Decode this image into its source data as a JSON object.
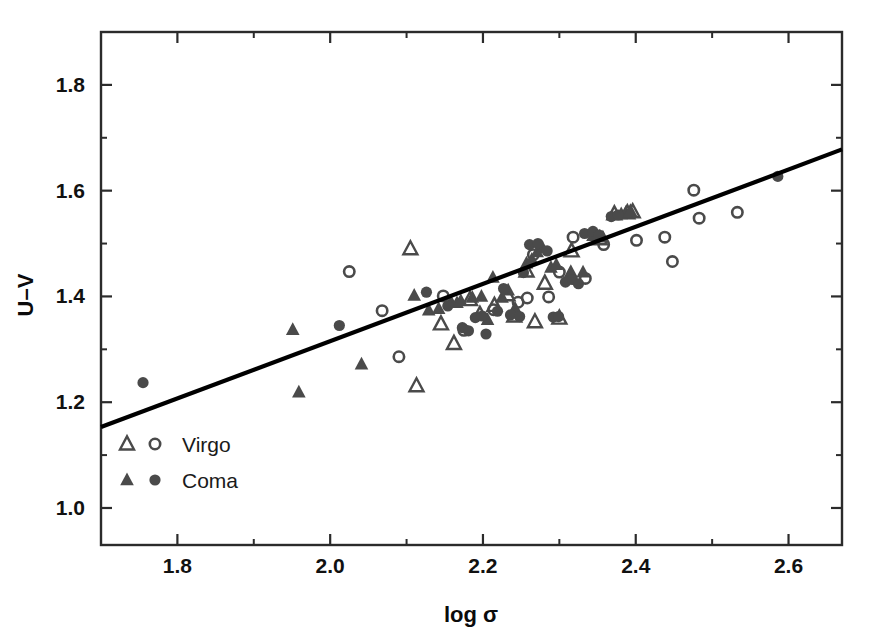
{
  "figure": {
    "background_color": "#ffffff",
    "frame_color": "#2b2b2b",
    "marker_color": "#4a4a4a",
    "fitline_color": "#000000"
  },
  "chart_data": {
    "type": "scatter",
    "title": "",
    "xlabel": "log σ",
    "ylabel": "U–V",
    "xlim": [
      1.7,
      2.67
    ],
    "ylim": [
      0.93,
      1.9
    ],
    "grid": false,
    "xticks": [
      1.8,
      2.0,
      2.2,
      2.4,
      2.6
    ],
    "xtick_labels": [
      "1.8",
      "2.0",
      "2.2",
      "2.4",
      "2.6"
    ],
    "yticks": [
      1.0,
      1.2,
      1.4,
      1.6,
      1.8
    ],
    "ytick_labels": [
      "1.0",
      "1.2",
      "1.4",
      "1.6",
      "1.8"
    ],
    "x_minor_ticks": [
      1.9,
      2.1,
      2.3,
      2.5
    ],
    "y_minor_ticks": [
      1.1,
      1.3,
      1.5,
      1.7
    ],
    "legend_position": "lower-left",
    "legend": [
      {
        "name": "Virgo",
        "markers": [
          "open-triangle",
          "open-circle"
        ],
        "filled": false
      },
      {
        "name": "Coma",
        "markers": [
          "filled-triangle",
          "filled-circle"
        ],
        "filled": true
      }
    ],
    "fit_line": {
      "name": "linear fit",
      "x": [
        1.7,
        2.67
      ],
      "y": [
        1.153,
        1.678
      ],
      "slope": 0.541,
      "intercept": 0.233
    },
    "series": [
      {
        "name": "Virgo",
        "marker": "open-triangle",
        "points": [
          [
            2.105,
            1.49
          ],
          [
            2.113,
            1.231
          ],
          [
            2.145,
            1.348
          ],
          [
            2.162,
            1.311
          ],
          [
            2.183,
            1.394
          ],
          [
            2.196,
            1.366
          ],
          [
            2.215,
            1.383
          ],
          [
            2.232,
            1.403
          ],
          [
            2.241,
            1.363
          ],
          [
            2.257,
            1.448
          ],
          [
            2.268,
            1.352
          ],
          [
            2.281,
            1.425
          ],
          [
            2.3,
            1.359
          ],
          [
            2.316,
            1.486
          ],
          [
            2.353,
            1.509
          ],
          [
            2.372,
            1.556
          ],
          [
            2.389,
            1.558
          ],
          [
            2.396,
            1.56
          ]
        ]
      },
      {
        "name": "Virgo",
        "marker": "open-circle",
        "points": [
          [
            2.025,
            1.447
          ],
          [
            2.068,
            1.373
          ],
          [
            2.09,
            1.286
          ],
          [
            2.148,
            1.401
          ],
          [
            2.175,
            1.336
          ],
          [
            2.214,
            1.375
          ],
          [
            2.246,
            1.389
          ],
          [
            2.258,
            1.397
          ],
          [
            2.266,
            1.479
          ],
          [
            2.286,
            1.399
          ],
          [
            2.3,
            1.446
          ],
          [
            2.318,
            1.512
          ],
          [
            2.334,
            1.434
          ],
          [
            2.358,
            1.498
          ],
          [
            2.401,
            1.506
          ],
          [
            2.438,
            1.512
          ],
          [
            2.448,
            1.466
          ],
          [
            2.476,
            1.601
          ],
          [
            2.483,
            1.548
          ],
          [
            2.533,
            1.559
          ]
        ]
      },
      {
        "name": "Coma",
        "marker": "filled-triangle",
        "points": [
          [
            1.951,
            1.337
          ],
          [
            1.959,
            1.219
          ],
          [
            2.041,
            1.272
          ],
          [
            2.11,
            1.402
          ],
          [
            2.129,
            1.374
          ],
          [
            2.142,
            1.377
          ],
          [
            2.158,
            1.39
          ],
          [
            2.166,
            1.388
          ],
          [
            2.171,
            1.392
          ],
          [
            2.186,
            1.398
          ],
          [
            2.198,
            1.4
          ],
          [
            2.206,
            1.356
          ],
          [
            2.213,
            1.436
          ],
          [
            2.225,
            1.398
          ],
          [
            2.233,
            1.412
          ],
          [
            2.242,
            1.378
          ],
          [
            2.257,
            1.463
          ],
          [
            2.264,
            1.47
          ],
          [
            2.271,
            1.484
          ],
          [
            2.278,
            1.492
          ],
          [
            2.289,
            1.455
          ],
          [
            2.296,
            1.46
          ],
          [
            2.315,
            1.447
          ],
          [
            2.331,
            1.446
          ],
          [
            2.344,
            1.515
          ],
          [
            2.357,
            1.512
          ],
          [
            2.381,
            1.556
          ],
          [
            2.387,
            1.559
          ],
          [
            2.393,
            1.562
          ]
        ]
      },
      {
        "name": "Coma",
        "marker": "filled-circle",
        "points": [
          [
            1.755,
            1.237
          ],
          [
            2.012,
            1.345
          ],
          [
            2.126,
            1.408
          ],
          [
            2.154,
            1.382
          ],
          [
            2.173,
            1.341
          ],
          [
            2.181,
            1.335
          ],
          [
            2.19,
            1.36
          ],
          [
            2.199,
            1.363
          ],
          [
            2.204,
            1.329
          ],
          [
            2.219,
            1.372
          ],
          [
            2.227,
            1.415
          ],
          [
            2.236,
            1.365
          ],
          [
            2.248,
            1.362
          ],
          [
            2.253,
            1.445
          ],
          [
            2.261,
            1.498
          ],
          [
            2.272,
            1.5
          ],
          [
            2.284,
            1.486
          ],
          [
            2.292,
            1.361
          ],
          [
            2.299,
            1.362
          ],
          [
            2.308,
            1.427
          ],
          [
            2.317,
            1.432
          ],
          [
            2.325,
            1.424
          ],
          [
            2.333,
            1.519
          ],
          [
            2.344,
            1.523
          ],
          [
            2.352,
            1.516
          ],
          [
            2.368,
            1.551
          ],
          [
            2.377,
            1.554
          ],
          [
            2.586,
            1.627
          ]
        ]
      }
    ]
  }
}
